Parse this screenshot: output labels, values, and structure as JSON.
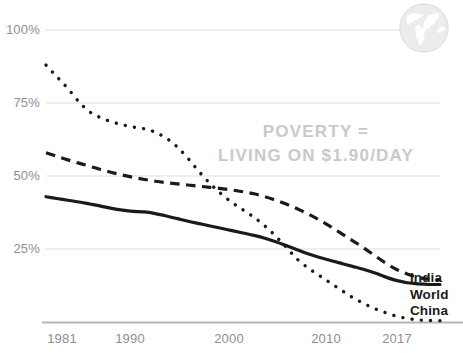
{
  "chart_data": {
    "type": "line",
    "title": "",
    "subtitle": "",
    "xlabel": "",
    "ylabel": "",
    "xlim": [
      1981,
      2017
    ],
    "ylim": [
      0,
      100
    ],
    "grid": true,
    "legend_position": "right",
    "annotations": [
      {
        "id": "poverty-definition",
        "line1": "POVERTY =",
        "line2": "LIVING ON $1.90/DAY",
        "color": "#c9c9cc"
      }
    ],
    "xticks": [
      1981,
      1990,
      2000,
      2010,
      2017
    ],
    "xtick_labels": [
      "1981",
      "1990",
      "2000",
      "2010",
      "2017"
    ],
    "yticks": [
      0,
      25,
      50,
      75,
      100
    ],
    "ytick_labels": [
      "",
      "25%",
      "50%",
      "75%",
      "100%"
    ],
    "x": [
      1981,
      1982,
      1983,
      1984,
      1985,
      1986,
      1987,
      1988,
      1989,
      1990,
      1991,
      1992,
      1993,
      1994,
      1995,
      1996,
      1997,
      1998,
      1999,
      2000,
      2001,
      2002,
      2003,
      2004,
      2005,
      2006,
      2007,
      2008,
      2009,
      2010,
      2011,
      2012,
      2013,
      2014,
      2015,
      2016,
      2017
    ],
    "series": [
      {
        "name": "India",
        "style": "solid",
        "color": "#1a1a1a",
        "values": [
          43.0,
          42.4,
          41.8,
          41.2,
          40.5,
          39.8,
          39.0,
          38.4,
          38.0,
          37.8,
          37.2,
          36.4,
          35.5,
          34.6,
          33.8,
          33.0,
          32.2,
          31.4,
          30.6,
          29.8,
          28.8,
          27.6,
          26.2,
          24.8,
          23.4,
          22.2,
          21.2,
          20.2,
          19.2,
          18.2,
          17.0,
          15.6,
          14.4,
          13.6,
          13.2,
          13.0,
          13.0
        ]
      },
      {
        "name": "World",
        "style": "dashed",
        "color": "#1a1a1a",
        "values": [
          58.0,
          56.8,
          55.6,
          54.5,
          53.4,
          52.3,
          51.3,
          50.4,
          49.6,
          48.9,
          48.3,
          47.8,
          47.4,
          47.0,
          46.6,
          46.2,
          45.8,
          45.3,
          44.7,
          44.0,
          43.0,
          41.8,
          40.4,
          38.8,
          37.0,
          35.0,
          32.8,
          30.4,
          28.0,
          25.6,
          23.0,
          20.4,
          18.2,
          16.6,
          15.4,
          14.8,
          14.6
        ]
      },
      {
        "name": "China",
        "style": "dotted",
        "color": "#1a1a1a",
        "values": [
          88.0,
          84.0,
          80.0,
          75.5,
          72.0,
          70.0,
          68.6,
          67.6,
          66.8,
          66.2,
          65.0,
          63.0,
          60.0,
          56.0,
          51.5,
          47.5,
          44.0,
          41.0,
          38.5,
          36.0,
          33.0,
          29.5,
          25.5,
          21.5,
          18.5,
          16.0,
          13.5,
          11.0,
          8.6,
          6.6,
          4.8,
          3.4,
          2.2,
          1.4,
          0.9,
          0.7,
          0.6
        ]
      }
    ]
  },
  "legend": {
    "items": [
      {
        "label": "India",
        "style": "solid"
      },
      {
        "label": "World",
        "style": "dashed"
      },
      {
        "label": "China",
        "style": "dotted"
      }
    ]
  },
  "icons": {
    "globe": "globe-icon"
  },
  "colors": {
    "line": "#1a1a1a",
    "gridline": "#e8e8ea",
    "axis": "#b6b6b9",
    "tick_text": "#8e8e91",
    "annotation_text": "#c9c9cc",
    "watermark": "#ececed",
    "background": "#ffffff"
  }
}
